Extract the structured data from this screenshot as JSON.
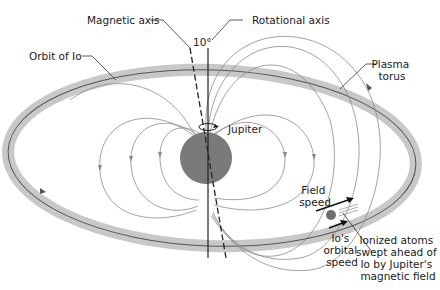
{
  "diagram": {
    "colors": {
      "torus": "#c8c8c8",
      "orbit_line": "#555555",
      "planet": "#7a7a7a",
      "field_lines": "#8a8a8a",
      "text": "#1a1a1a",
      "io": "#6e6e6e"
    },
    "labels": {
      "magnetic_axis": "Magnetic axis",
      "rotational_axis": "Rotational axis",
      "tilt_angle": "10°",
      "orbit_of_io": "Orbit of Io",
      "plasma_torus_line1": "Plasma",
      "plasma_torus_line2": "torus",
      "jupiter": "Jupiter",
      "field_speed_line1": "Field",
      "field_speed_line2": "speed",
      "io_orbital_speed_line1": "Io's",
      "io_orbital_speed_line2": "orbital",
      "io_orbital_speed_line3": "speed",
      "ionized_line1": "Ionized atoms",
      "ionized_line2": "swept ahead of",
      "ionized_line3": "Io by Jupiter's",
      "ionized_line4": "magnetic field"
    },
    "icons": {
      "rotation_arrow": "rotation-arrow-icon",
      "field_direction_arrows": "arrow-icon"
    }
  }
}
